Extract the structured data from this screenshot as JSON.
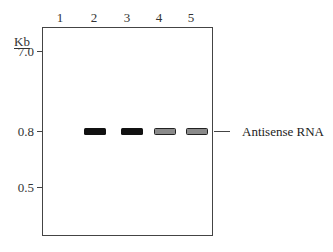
{
  "figure": {
    "type": "northern_blot_gel",
    "unit_label": "Kb",
    "lanes": [
      {
        "label": "1",
        "band": null
      },
      {
        "label": "2",
        "band": "strong"
      },
      {
        "label": "3",
        "band": "strong"
      },
      {
        "label": "4",
        "band": "weak"
      },
      {
        "label": "5",
        "band": "weak"
      }
    ],
    "size_markers": [
      {
        "label": "7.0",
        "kb": 7.0
      },
      {
        "label": "0.8",
        "kb": 0.8
      },
      {
        "label": "0.5",
        "kb": 0.5
      }
    ],
    "annotation": {
      "label": "Antisense RNA",
      "position_kb": 0.8
    },
    "colors": {
      "strong_band": "#111111",
      "weak_band_fill": "#8a8a8a",
      "frame": "#444444"
    }
  }
}
